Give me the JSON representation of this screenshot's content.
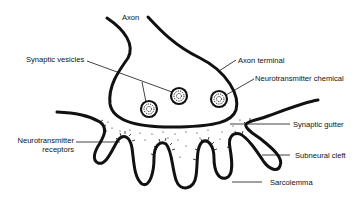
{
  "diagram": {
    "labels": {
      "axon": "Axon",
      "synaptic_vesicles": "Synaptic vesicles",
      "axon_terminal": "Axon terminal",
      "neurotransmitter_chemical": "Neurotransmitter chemical",
      "synaptic_gutter": "Synaptic gutter",
      "subneural_cleft": "Subneural cleft",
      "neurotransmitter_receptors_line1": "Neurotransmitter",
      "neurotransmitter_receptors_line2": "receptors",
      "sarcolemma": "Sarcolemma"
    },
    "colors": {
      "stroke": "#111111",
      "background": "#ffffff"
    }
  }
}
